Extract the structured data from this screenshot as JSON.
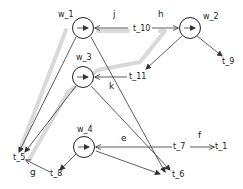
{
  "diagram": {
    "type": "workflow-net",
    "colors": {
      "line": "#333333",
      "highlight": "#d9d9d9",
      "node_fill": "#ffffff"
    },
    "transitions": [
      {
        "id": "w_1",
        "label": "w_1",
        "cx": 83,
        "cy": 28
      },
      {
        "id": "w_2",
        "label": "w_2",
        "cx": 190,
        "cy": 28
      },
      {
        "id": "w_3",
        "label": "w_3",
        "cx": 83,
        "cy": 77
      },
      {
        "id": "w_4",
        "label": "w_4",
        "cx": 84,
        "cy": 147
      }
    ],
    "places": [
      {
        "id": "t_10",
        "label": "t_10"
      },
      {
        "id": "t_11",
        "label": "t_11"
      },
      {
        "id": "t_9",
        "label": "t_9"
      },
      {
        "id": "t_5",
        "label": "t_5"
      },
      {
        "id": "t_8",
        "label": "t_8"
      },
      {
        "id": "t_6",
        "label": "t_6"
      },
      {
        "id": "t_7",
        "label": "t_7"
      },
      {
        "id": "t_1",
        "label": "t_1"
      }
    ],
    "edge_labels": {
      "j": "j",
      "h": "h",
      "k": "k",
      "e": "e",
      "f": "f",
      "g": "g"
    },
    "edges": [
      {
        "from": "t_10",
        "to": "w_1",
        "label": "j"
      },
      {
        "from": "t_10",
        "to": "w_2",
        "label": "h"
      },
      {
        "from": "w_2",
        "to": "t_11"
      },
      {
        "from": "w_2",
        "to": "t_9"
      },
      {
        "from": "t_11",
        "to": "w_3",
        "label": "k"
      },
      {
        "from": "w_1",
        "to": "t_5"
      },
      {
        "from": "w_1",
        "to": "t_6"
      },
      {
        "from": "w_3",
        "to": "t_5"
      },
      {
        "from": "w_3",
        "to": "t_6"
      },
      {
        "from": "t_7",
        "to": "w_4",
        "label": "e"
      },
      {
        "from": "t_7",
        "to": "t_1",
        "label": "f"
      },
      {
        "from": "w_4",
        "to": "t_8"
      },
      {
        "from": "w_4",
        "to": "t_6"
      },
      {
        "from": "t_8",
        "to": "t_5",
        "label": "g"
      }
    ]
  }
}
